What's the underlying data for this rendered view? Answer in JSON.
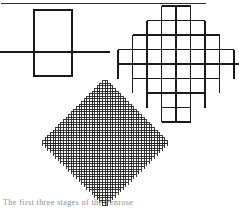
{
  "page": {
    "width": 239,
    "height": 211,
    "background": "#ffffff",
    "ink_color": "#1a1a1a",
    "caption_color": "#8d8d8d"
  },
  "rule": {
    "name": "top-horizontal-rule",
    "x1": 1,
    "x2": 206,
    "y": 3,
    "stroke_width": 0.9
  },
  "caption": {
    "text": "The first three stages of the Penrose figure",
    "visible_fragment": "The first three stages of the Penrose",
    "clipped": true
  },
  "figures": [
    {
      "id": "stage-1",
      "label": "Stage 1 - single square with axis",
      "type": "aztec-diamond-order",
      "order": 1,
      "cells": 1,
      "rows": [
        1
      ],
      "cell_size_px": 38,
      "box": {
        "x": 34,
        "y": 10,
        "width": 38,
        "height": 66
      },
      "axis": {
        "x1": 0,
        "x2": 110,
        "y": 52
      },
      "stroke_width": 1.25,
      "fill": "none"
    },
    {
      "id": "stage-2",
      "label": "Stage 2 - coarse diamond lattice with axis",
      "type": "aztec-diamond-order",
      "order": 4,
      "cells": 32,
      "rows": [
        2,
        4,
        6,
        8,
        8,
        6,
        4,
        2
      ],
      "cell_size_px": 14.5,
      "box": {
        "x": 124,
        "y": 8,
        "width": 104,
        "height": 112
      },
      "center": {
        "x": 176,
        "y": 64
      },
      "axis": {
        "x1": 118,
        "x2": 239,
        "y": 64
      },
      "stroke_width": 1.25,
      "fill": "none"
    },
    {
      "id": "stage-3",
      "label": "Stage 3 - fine diamond lattice with axis",
      "type": "aztec-diamond-order",
      "order": 22,
      "cells": 1012,
      "cell_size_px": 2.6,
      "box": {
        "x": 48,
        "y": 80,
        "width": 116,
        "height": 126
      },
      "center": {
        "x": 105,
        "y": 143
      },
      "axis": {
        "x1": 44,
        "x2": 168,
        "y": 143
      },
      "stroke_width": 0.85,
      "fill": "none"
    }
  ],
  "icons": {
    "figure_block": "geometric-figure-icon"
  }
}
